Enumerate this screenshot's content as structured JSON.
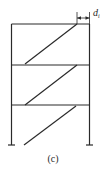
{
  "diagram": {
    "type": "multi-story frame with diagonal braces",
    "stories": 3,
    "dimension_label": {
      "base": "d",
      "subscript": "i"
    },
    "caption": "(c)"
  }
}
